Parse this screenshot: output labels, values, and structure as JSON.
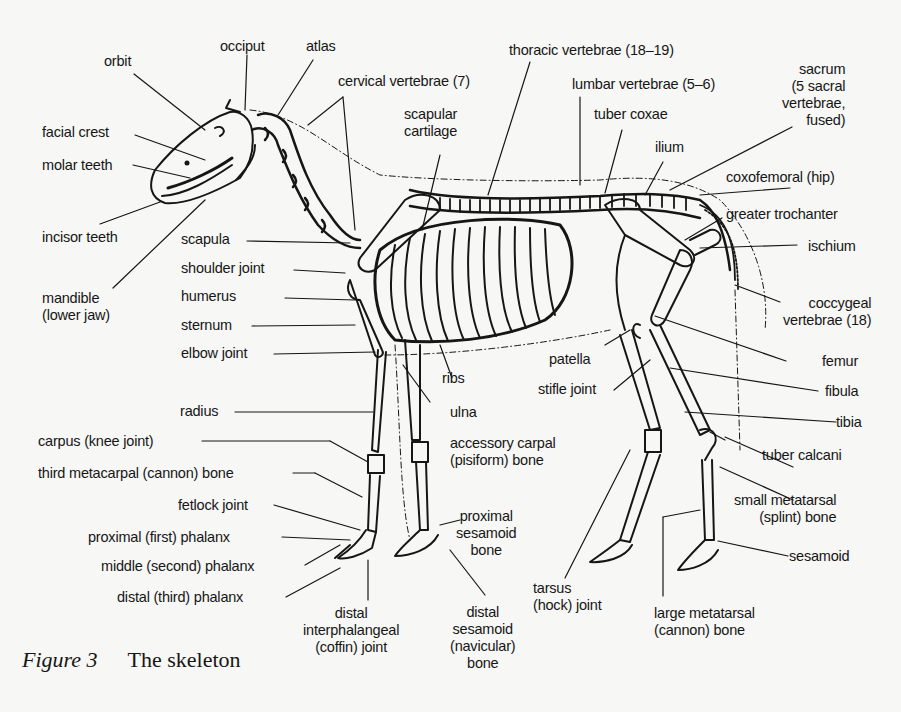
{
  "figure": {
    "caption_label": "Figure 3",
    "caption_title": "The skeleton"
  },
  "labels": {
    "orbit": "orbit",
    "occiput": "occiput",
    "atlas": "atlas",
    "cervical_vertebrae": "cervical vertebrae (7)",
    "thoracic_vertebrae": "thoracic vertebrae (18–19)",
    "lumbar_vertebrae": "lumbar vertebrae (5–6)",
    "sacrum": [
      "sacrum",
      "(5 sacral",
      "vertebrae,",
      "fused)"
    ],
    "facial_crest": "facial crest",
    "molar_teeth": "molar teeth",
    "scapular_cartilage": [
      "scapular",
      "cartilage"
    ],
    "tuber_coxae": "tuber coxae",
    "ilium": "ilium",
    "coxofemoral": "coxofemoral (hip)",
    "greater_trochanter": "greater trochanter",
    "incisor_teeth": "incisor teeth",
    "scapula": "scapula",
    "shoulder_joint": "shoulder joint",
    "ischium": "ischium",
    "humerus": "humerus",
    "mandible": [
      "mandible",
      "(lower jaw)"
    ],
    "coccygeal_vertebrae": [
      "coccygeal",
      "vertebrae (18)"
    ],
    "sternum": "sternum",
    "elbow_joint": "elbow joint",
    "patella": "patella",
    "femur": "femur",
    "ribs": "ribs",
    "stifle_joint": "stifle joint",
    "fibula": "fibula",
    "radius": "radius",
    "ulna": "ulna",
    "tibia": "tibia",
    "carpus": "carpus (knee joint)",
    "accessory_carpal": [
      "accessory carpal",
      "(pisiform) bone"
    ],
    "tuber_calcani": "tuber calcani",
    "third_metacarpal": "third metacarpal (cannon) bone",
    "fetlock_joint": "fetlock joint",
    "small_metatarsal": [
      "small metatarsal",
      "(splint) bone"
    ],
    "proximal_sesamoid": [
      "proximal",
      "sesamoid",
      "bone"
    ],
    "proximal_phalanx": "proximal (first) phalanx",
    "middle_phalanx": "middle (second) phalanx",
    "sesamoid": "sesamoid",
    "distal_phalanx": "distal (third) phalanx",
    "distal_interphalangeal": [
      "distal",
      "interphalangeal",
      "(coffin) joint"
    ],
    "distal_sesamoid": [
      "distal",
      "sesamoid",
      "(navicular)",
      "bone"
    ],
    "tarsus": [
      "tarsus",
      "(hock) joint"
    ],
    "large_metatarsal": [
      "large metatarsal",
      "(cannon) bone"
    ]
  },
  "colors": {
    "ink": "#161616",
    "paper": "#f7f7f5"
  }
}
